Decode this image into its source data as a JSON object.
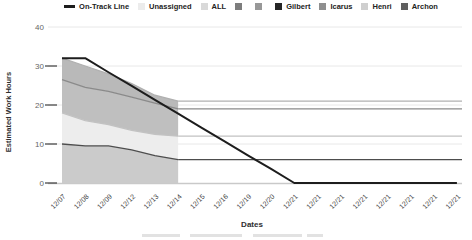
{
  "legend": {
    "items": [
      {
        "label": "On-Track Line",
        "swatch": "#1d1d1d",
        "type": "line"
      },
      {
        "label": "Unassigned",
        "swatch": "#ececec",
        "type": "square"
      },
      {
        "label": "ALL",
        "swatch": "#d9d9d9",
        "type": "square"
      },
      {
        "label": "",
        "swatch": "#7d7d7d",
        "type": "square"
      },
      {
        "label": "",
        "swatch": "#989898",
        "type": "square"
      },
      {
        "label": "Gilbert",
        "swatch": "#262626",
        "type": "square"
      },
      {
        "label": "Icarus",
        "swatch": "#8f8f8f",
        "type": "square"
      },
      {
        "label": "Henri",
        "swatch": "#cfcfcf",
        "type": "square"
      },
      {
        "label": "Archon",
        "swatch": "#5f5f5f",
        "type": "square"
      }
    ]
  },
  "axes": {
    "y_title": "Estimated Work Hours",
    "x_title": "Dates"
  },
  "chart_data": {
    "type": "area",
    "title": "",
    "xlabel": "Dates",
    "ylabel": "Estimated Work Hours",
    "ylim": [
      0,
      40
    ],
    "yticks": [
      0,
      10,
      20,
      30,
      40
    ],
    "tick_marks": [
      0,
      10,
      20,
      30
    ],
    "grid": "on",
    "legend_position": "top",
    "x_labels": [
      "12/07",
      "12/08",
      "12/09",
      "12/12",
      "12/13",
      "12/14",
      "12/15",
      "12/16",
      "12/19",
      "12/20",
      "12/21",
      "12/21",
      "12/21",
      "12/21",
      "12/21",
      "12/21",
      "12/21",
      "12/21"
    ],
    "on_track_line": {
      "name": "On-Track Line",
      "color": "#1d1d1d",
      "values": [
        32,
        32,
        28.4,
        24.9,
        21.3,
        17.8,
        14.2,
        10.7,
        7.1,
        3.6,
        0,
        0,
        0,
        0,
        0,
        0,
        0,
        0
      ]
    },
    "stacked_bands": {
      "x_index_span": [
        0,
        5
      ],
      "x_labels_span": [
        "12/07",
        "12/14"
      ],
      "bands_bottom_to_top": [
        {
          "name": "band-1-bottom",
          "fill": "#cbcbcb",
          "line_color": "#4d4d4d",
          "cumulative_top": [
            10,
            9.5,
            9.5,
            8.5,
            7,
            6
          ],
          "tail_value": 6
        },
        {
          "name": "band-2",
          "fill": "#ededed",
          "line_color": "#c2c2c2",
          "cumulative_top": [
            18,
            16,
            15,
            13.5,
            12.5,
            12
          ],
          "tail_value": 12
        },
        {
          "name": "band-3",
          "fill": "#bfbfbf",
          "line_color": "#8a8a8a",
          "cumulative_top": [
            26.5,
            24.5,
            23.5,
            22,
            20.5,
            19
          ],
          "tail_value": 19
        },
        {
          "name": "band-4-top",
          "fill": "#b9b9b9",
          "line_color": "#b0b0b0",
          "cumulative_top": [
            32,
            30,
            28,
            25.5,
            22.5,
            21
          ],
          "tail_value": 21
        }
      ]
    },
    "colors": {
      "gridline": "#e8e8e8",
      "baseline": "#c9c9c9",
      "tick": "#3d3d3d",
      "tick_label": "#666666",
      "x_label": "#3d3d3d"
    }
  }
}
